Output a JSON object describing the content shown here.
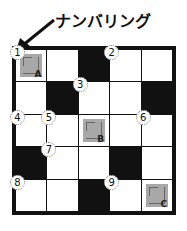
{
  "title": "ナンバリング",
  "grid": {
    "rows": 5,
    "cols": 5,
    "cells": [
      [
        {
          "type": "grey",
          "number": "1",
          "letter": "A"
        },
        {
          "type": "white"
        },
        {
          "type": "black"
        },
        {
          "type": "white",
          "number": "2"
        },
        {
          "type": "white"
        }
      ],
      [
        {
          "type": "white"
        },
        {
          "type": "black"
        },
        {
          "type": "white",
          "number": "3"
        },
        {
          "type": "white"
        },
        {
          "type": "black"
        }
      ],
      [
        {
          "type": "white",
          "number": "4"
        },
        {
          "type": "white",
          "number": "5"
        },
        {
          "type": "grey",
          "letter": "B"
        },
        {
          "type": "white"
        },
        {
          "type": "white",
          "number": "6"
        }
      ],
      [
        {
          "type": "black"
        },
        {
          "type": "white",
          "number": "7"
        },
        {
          "type": "white"
        },
        {
          "type": "black"
        },
        {
          "type": "white"
        }
      ],
      [
        {
          "type": "white",
          "number": "8"
        },
        {
          "type": "white"
        },
        {
          "type": "black"
        },
        {
          "type": "white",
          "number": "9"
        },
        {
          "type": "grey",
          "letter": "C"
        }
      ]
    ]
  },
  "colors": {
    "black": "#111111",
    "grey": "#a8a8a8",
    "white": "#ffffff"
  }
}
